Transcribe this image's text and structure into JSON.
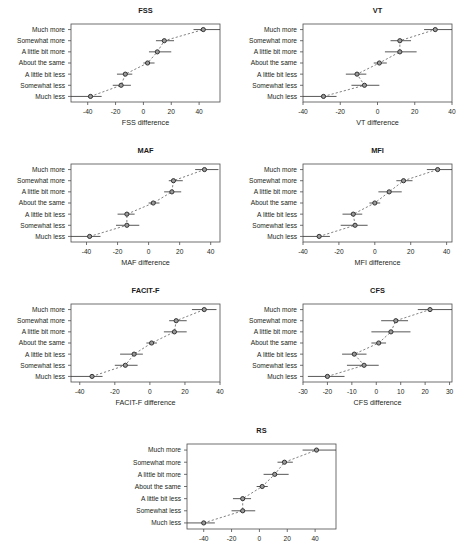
{
  "figure": {
    "categories": [
      "Much more",
      "Somewhat more",
      "A little bit more",
      "About the same",
      "A little bit less",
      "Somewhat less",
      "Much less"
    ],
    "marker_fill": "#9a9a9a",
    "marker_stroke": "#262626",
    "line_color": "#6b6b6b",
    "frame_color": "#4d4d4d"
  },
  "chart_data": [
    {
      "type": "scatter",
      "title": "FSS",
      "xlabel": "FSS difference",
      "ylabel": "",
      "xlim": [
        -52,
        55
      ],
      "xticks": [
        -40,
        -20,
        0,
        20,
        40
      ],
      "categories": [
        "Much more",
        "Somewhat more",
        "A little bit more",
        "About the same",
        "A little bit less",
        "Somewhat less",
        "Much less"
      ],
      "values": [
        43,
        15,
        10,
        3,
        -13,
        -16,
        -38
      ],
      "ci_low": [
        36,
        9,
        4,
        0,
        -19,
        -22,
        -52
      ],
      "ci_high": [
        55,
        22,
        20,
        8,
        -8,
        -9,
        -30
      ],
      "grid": false,
      "legend": "none"
    },
    {
      "type": "scatter",
      "title": "VT",
      "xlabel": "VT difference",
      "ylabel": "",
      "xlim": [
        -40,
        40
      ],
      "xticks": [
        -40,
        -20,
        0,
        20,
        40
      ],
      "categories": [
        "Much more",
        "Somewhat more",
        "A little bit more",
        "About the same",
        "A little bit less",
        "Somewhat less",
        "Much less"
      ],
      "values": [
        31,
        12,
        12,
        1,
        -11,
        -7,
        -29
      ],
      "ci_low": [
        25,
        7,
        4,
        -2,
        -17,
        -14,
        -40
      ],
      "ci_high": [
        40,
        18,
        21,
        5,
        -6,
        1,
        -22
      ],
      "grid": false,
      "legend": "none"
    },
    {
      "type": "scatter",
      "title": "MAF",
      "xlabel": "MAF difference",
      "ylabel": "",
      "xlim": [
        -50,
        46
      ],
      "xticks": [
        -40,
        -20,
        0,
        20,
        40
      ],
      "categories": [
        "Much more",
        "Somewhat more",
        "A little bit more",
        "About the same",
        "A little bit less",
        "Somewhat less",
        "Much less"
      ],
      "values": [
        36,
        16,
        15,
        3,
        -14,
        -14,
        -38
      ],
      "ci_low": [
        30,
        13,
        10,
        0,
        -20,
        -21,
        -50
      ],
      "ci_high": [
        45,
        22,
        21,
        7,
        -9,
        -6,
        -31
      ],
      "grid": false,
      "legend": "none"
    },
    {
      "type": "scatter",
      "title": "MFI",
      "xlabel": "MFI difference",
      "ylabel": "",
      "xlim": [
        -40,
        43
      ],
      "xticks": [
        -40,
        -20,
        0,
        20,
        40
      ],
      "categories": [
        "Much more",
        "Somewhat more",
        "A little bit more",
        "About the same",
        "A little bit less",
        "Somewhat less",
        "Much less"
      ],
      "values": [
        35,
        16,
        8,
        0,
        -12,
        -11,
        -31
      ],
      "ci_low": [
        29,
        12,
        2,
        -3,
        -18,
        -19,
        -40
      ],
      "ci_high": [
        43,
        21,
        15,
        3,
        -7,
        -4,
        -25
      ],
      "grid": false,
      "legend": "none"
    },
    {
      "type": "scatter",
      "title": "FACIT-F",
      "xlabel": "FACIT-F difference",
      "ylabel": "",
      "xlim": [
        -45,
        40
      ],
      "xticks": [
        -40,
        -20,
        0,
        20,
        40
      ],
      "categories": [
        "Much more",
        "Somewhat more",
        "A little bit more",
        "About the same",
        "A little bit less",
        "Somewhat less",
        "Much less"
      ],
      "values": [
        31,
        15,
        14,
        1,
        -9,
        -14,
        -33
      ],
      "ci_low": [
        24,
        11,
        8,
        -2,
        -17,
        -20,
        -45
      ],
      "ci_high": [
        38,
        21,
        21,
        4,
        -4,
        -7,
        -27
      ],
      "grid": false,
      "legend": "none"
    },
    {
      "type": "scatter",
      "title": "CFS",
      "xlabel": "CFS difference",
      "ylabel": "",
      "xlim": [
        -30,
        31
      ],
      "xticks": [
        -30,
        -20,
        -10,
        0,
        10,
        20,
        30
      ],
      "categories": [
        "Much more",
        "Somewhat more",
        "A little bit more",
        "About the same",
        "A little bit less",
        "Somewhat less",
        "Much less"
      ],
      "values": [
        22,
        8,
        6,
        1,
        -9,
        -5,
        -20
      ],
      "ci_low": [
        17,
        2,
        -2,
        -2,
        -14,
        -12,
        -28
      ],
      "ci_high": [
        31,
        13,
        14,
        4,
        -4,
        1,
        -13
      ],
      "grid": false,
      "legend": "none"
    },
    {
      "type": "scatter",
      "title": "RS",
      "xlabel": "",
      "ylabel": "",
      "xlim": [
        -52,
        55
      ],
      "xticks": [
        -40,
        -20,
        0,
        20,
        40
      ],
      "categories": [
        "Much more",
        "Somewhat more",
        "A little bit more",
        "About the same",
        "A little bit less",
        "Somewhat less",
        "Much less"
      ],
      "values": [
        41,
        18,
        11,
        2,
        -12,
        -12,
        -40
      ],
      "ci_low": [
        31,
        13,
        3,
        -2,
        -19,
        -20,
        -52
      ],
      "ci_high": [
        55,
        24,
        21,
        6,
        -6,
        -3,
        -32
      ],
      "grid": false,
      "legend": "none"
    }
  ]
}
